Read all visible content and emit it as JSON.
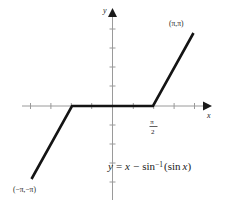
{
  "chart_data": {
    "type": "line",
    "title": "",
    "equation_text": "y = x − sin⁻¹(sin x)",
    "equation_parts": {
      "y": "y",
      "equals": "=",
      "x": "x",
      "minus": "−",
      "sin": "sin",
      "exponent": "−1",
      "open_paren": "(",
      "sin2": "sin",
      "x2": "x",
      "close_paren": ")"
    },
    "xlabel": "x",
    "ylabel": "y",
    "xlim": [
      -3.6,
      3.6
    ],
    "ylim": [
      -3.9,
      3.6
    ],
    "grid": false,
    "legend": "none",
    "x_tick_labels": [
      {
        "value": 1.5708,
        "text_numerator": "π",
        "text_denominator": "2",
        "position": "below-axis"
      }
    ],
    "annotations": [
      {
        "text": "(π,π)",
        "x": 3.14159,
        "y": 3.14159,
        "placement": "above-left-of-endpoint"
      },
      {
        "text": "(−π,−π)",
        "x": -3.14159,
        "y": -3.14159,
        "placement": "below-right-of-endpoint"
      }
    ],
    "series": [
      {
        "name": "y = x - arcsin(sin x)",
        "points": [
          {
            "x": -3.14159,
            "y": -3.14159
          },
          {
            "x": -1.5708,
            "y": 0
          },
          {
            "x": 1.5708,
            "y": 0
          },
          {
            "x": 3.14159,
            "y": 3.14159
          }
        ],
        "color": "#141414"
      }
    ],
    "axes": {
      "x_axis_color": "#9a9a9a",
      "y_axis_color": "#9a9a9a",
      "arrowheads": [
        "x-positive",
        "y-positive"
      ],
      "tick_interval": 0.7854
    },
    "curve_color": "#141414",
    "background_color": "#ffffff"
  }
}
